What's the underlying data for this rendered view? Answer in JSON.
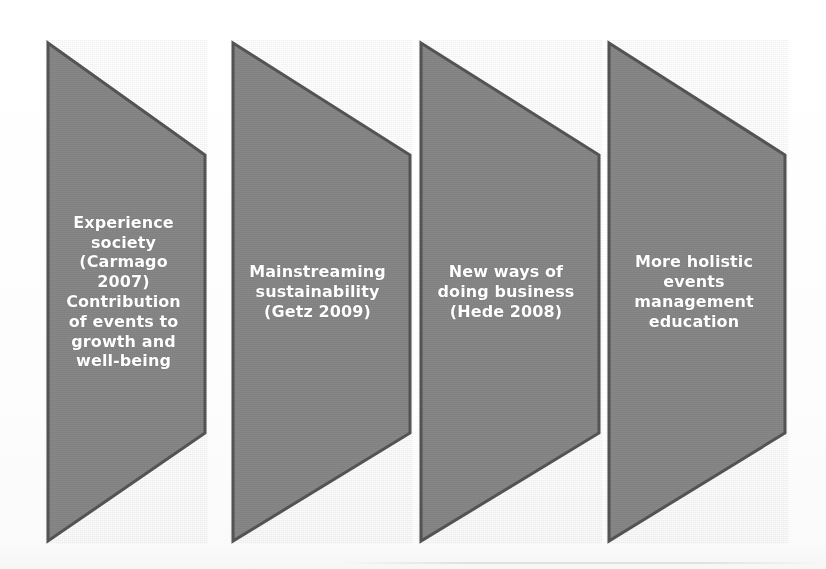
{
  "diagram": {
    "type": "chevron-process-flow",
    "orientation": "left-to-right",
    "shape_fill": "#878787",
    "shape_border": "#555555",
    "text_color": "#ffffff",
    "background": "#ffffff",
    "steps": [
      {
        "id": "step-1",
        "index": 1,
        "label": "Experience\nsociety\n(Carmago\n2007)\nContribution\nof events to\ngrowth and\nwell-being",
        "font_size": "16px"
      },
      {
        "id": "step-2",
        "index": 2,
        "label": "Mainstreaming\nsustainability\n(Getz 2009)",
        "font_size": "16px"
      },
      {
        "id": "step-3",
        "index": 3,
        "label": "New ways of\ndoing business\n(Hede 2008)",
        "font_size": "16px"
      },
      {
        "id": "step-4",
        "index": 4,
        "label": "More holistic\nevents\nmanagement\neducation",
        "font_size": "16px"
      }
    ]
  }
}
